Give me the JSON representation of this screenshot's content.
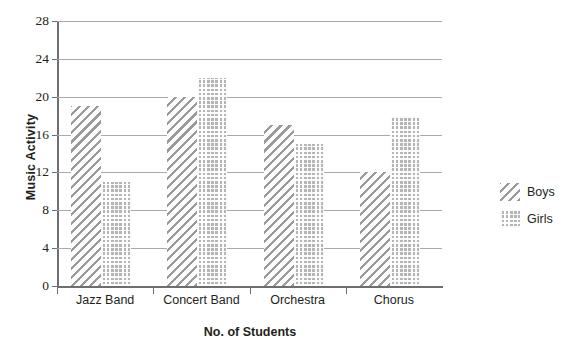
{
  "chart_data": {
    "type": "bar",
    "title": "",
    "subtitle": "",
    "xlabel": "No. of Students",
    "ylabel": "Music Activity",
    "categories": [
      "Jazz Band",
      "Concert Band",
      "Orchestra",
      "Chorus"
    ],
    "series": [
      {
        "name": "Boys",
        "values": [
          19,
          20,
          17,
          12
        ],
        "pattern": "diagonal-hatch",
        "color": "#9a9a9a"
      },
      {
        "name": "Girls",
        "values": [
          11,
          22,
          15,
          18
        ],
        "pattern": "cross-hatch-dotted",
        "color": "#b5b5b5"
      }
    ],
    "ylim": [
      0,
      28
    ],
    "ytick_labels": [
      "28",
      "24",
      "20",
      "16",
      "12",
      "8",
      "4",
      "0"
    ],
    "ytick_values": [
      28,
      24,
      20,
      16,
      12,
      8,
      4,
      0
    ],
    "ytick_step": 4,
    "grid": true,
    "grid_axis": "y",
    "legend_position": "right",
    "legend_entries": [
      "Boys",
      "Girls"
    ],
    "bar_group_gap": true,
    "annotations": []
  },
  "legend": {
    "items": [
      {
        "label": "Boys"
      },
      {
        "label": "Girls"
      }
    ]
  },
  "axes": {
    "y_title": "Music Activity",
    "x_title": "No. of Students"
  }
}
